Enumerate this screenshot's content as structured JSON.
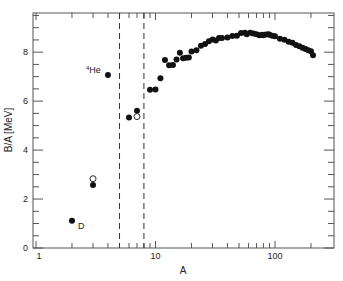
{
  "chart_data": {
    "type": "scatter",
    "title": "",
    "xlabel": "A",
    "ylabel": "B/A [MeV]",
    "xscale": "log",
    "xlim": [
      1,
      250
    ],
    "ylim": [
      0,
      9.6
    ],
    "x_ticks": [
      {
        "v": 1,
        "label": "1"
      },
      {
        "v": 10,
        "label": "10"
      },
      {
        "v": 100,
        "label": "100"
      }
    ],
    "y_ticks": [
      {
        "v": 0,
        "label": "0"
      },
      {
        "v": 2,
        "label": "2"
      },
      {
        "v": 4,
        "label": "4"
      },
      {
        "v": 6,
        "label": "6"
      },
      {
        "v": 8,
        "label": "8"
      }
    ],
    "grid": false,
    "vlines": [
      {
        "x": 5,
        "style": "dashed"
      },
      {
        "x": 8,
        "style": "dashed"
      }
    ],
    "annotations": [
      {
        "text": "D",
        "x": 2,
        "y": 1.11,
        "dx": 6,
        "dy": 8
      },
      {
        "text": "He",
        "sup": "4",
        "x": 4,
        "y": 7.07,
        "dx": -22,
        "dy": -2
      }
    ],
    "series": [
      {
        "name": "stable nuclei",
        "marker": "filled-circle",
        "points": [
          [
            2,
            1.11
          ],
          [
            3,
            2.57
          ],
          [
            4,
            7.07
          ],
          [
            6,
            5.33
          ],
          [
            7,
            5.61
          ],
          [
            9,
            6.46
          ],
          [
            10,
            6.48
          ],
          [
            11,
            6.93
          ],
          [
            12,
            7.68
          ],
          [
            13,
            7.47
          ],
          [
            14,
            7.48
          ],
          [
            15,
            7.7
          ],
          [
            16,
            7.98
          ],
          [
            17,
            7.75
          ],
          [
            18,
            7.77
          ],
          [
            19,
            7.78
          ],
          [
            20,
            8.03
          ],
          [
            22,
            8.08
          ],
          [
            24,
            8.26
          ],
          [
            26,
            8.33
          ],
          [
            28,
            8.45
          ],
          [
            30,
            8.52
          ],
          [
            32,
            8.48
          ],
          [
            34,
            8.58
          ],
          [
            36,
            8.58
          ],
          [
            40,
            8.6
          ],
          [
            44,
            8.66
          ],
          [
            48,
            8.67
          ],
          [
            52,
            8.78
          ],
          [
            56,
            8.79
          ],
          [
            58,
            8.73
          ],
          [
            62,
            8.79
          ],
          [
            66,
            8.76
          ],
          [
            70,
            8.73
          ],
          [
            74,
            8.69
          ],
          [
            78,
            8.71
          ],
          [
            80,
            8.69
          ],
          [
            84,
            8.72
          ],
          [
            88,
            8.73
          ],
          [
            90,
            8.71
          ],
          [
            95,
            8.67
          ],
          [
            100,
            8.65
          ],
          [
            110,
            8.55
          ],
          [
            120,
            8.51
          ],
          [
            130,
            8.43
          ],
          [
            140,
            8.38
          ],
          [
            150,
            8.29
          ],
          [
            160,
            8.24
          ],
          [
            170,
            8.18
          ],
          [
            180,
            8.13
          ],
          [
            190,
            8.08
          ],
          [
            200,
            8.04
          ],
          [
            208,
            7.87
          ]
        ]
      },
      {
        "name": "unstable / alternate",
        "marker": "open-circle",
        "points": [
          [
            3,
            2.83
          ],
          [
            7,
            5.37
          ]
        ]
      }
    ],
    "legend": null
  }
}
